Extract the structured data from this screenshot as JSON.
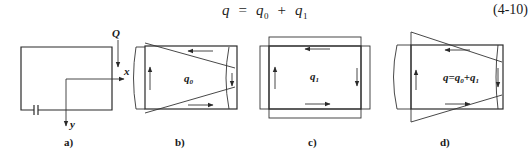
{
  "equation": {
    "lhs": "q",
    "equals": "=",
    "term1": "q",
    "term1_sub": "0",
    "plus": "+",
    "term2": "q",
    "term2_sub": "1",
    "number": "(4-10)"
  },
  "panels": [
    {
      "id": "a",
      "caption": "a)",
      "labels": {
        "load": "Q",
        "x_axis": "x",
        "y_axis": "y"
      }
    },
    {
      "id": "b",
      "caption": "b)",
      "flow_label": "q",
      "flow_sub": "0"
    },
    {
      "id": "c",
      "caption": "c)",
      "flow_label": "q",
      "flow_sub": "1"
    },
    {
      "id": "d",
      "caption": "d)",
      "flow_label": "q=q",
      "flow_sub": "0",
      "flow_plus": "+q",
      "flow_sub2": "1"
    }
  ]
}
